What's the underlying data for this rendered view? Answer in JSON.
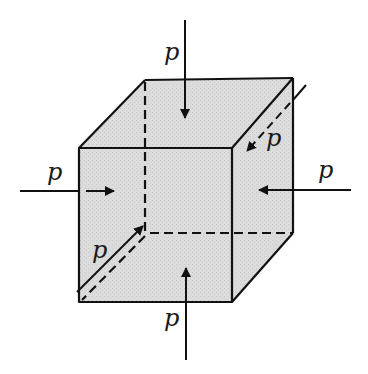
{
  "diagram": {
    "type": "cube-under-hydrostatic-pressure",
    "colors": {
      "fill": "#d8d8d8",
      "stroke": "#111111",
      "background": "#ffffff"
    },
    "cube": {
      "front_face": [
        [
          79,
          148
        ],
        [
          232,
          148
        ],
        [
          232,
          302
        ],
        [
          79,
          302
        ]
      ],
      "back_face": [
        [
          145,
          80
        ],
        [
          293,
          78
        ],
        [
          293,
          233
        ],
        [
          145,
          233
        ]
      ],
      "hidden_edges": [
        "back-left-vertical",
        "back-bottom-horizontal",
        "back-bottom-left-diagonal"
      ]
    },
    "forces": [
      {
        "id": "top",
        "label": "p",
        "direction": "down"
      },
      {
        "id": "bottom",
        "label": "p",
        "direction": "up"
      },
      {
        "id": "left",
        "label": "p",
        "direction": "right"
      },
      {
        "id": "right",
        "label": "p",
        "direction": "left"
      },
      {
        "id": "back",
        "label": "p",
        "direction": "toward-viewer-diagonal"
      },
      {
        "id": "front",
        "label": "p",
        "direction": "away-from-viewer-diagonal"
      }
    ],
    "labels": {
      "top": "p",
      "bottom": "p",
      "left": "p",
      "right": "p",
      "back": "p",
      "front": "p"
    }
  }
}
